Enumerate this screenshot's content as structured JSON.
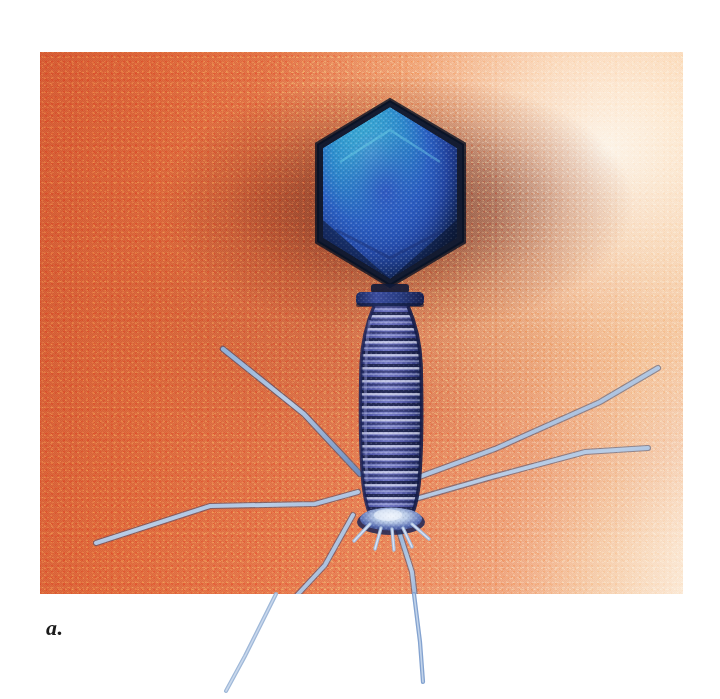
{
  "figure": {
    "panel_label": "a.",
    "image_kind": "colorized-electron-micrograph",
    "plate": {
      "left": 40,
      "top": 52,
      "width": 643,
      "height": 542
    },
    "colors": {
      "background_orange": "#e0703f",
      "background_orange_dark": "#d45c34",
      "background_highlight_cream": "#fbe9d6",
      "vignette_shadow": "#5f1c0e",
      "capsid_rim_dark": "#0e1c33",
      "capsid_cyan": "#3ec3dc",
      "capsid_blue": "#2f5fc0",
      "capsid_deep_blue": "#1b3a86",
      "sheath_purple": "#5a5fb0",
      "sheath_band_light": "#e8ecf6",
      "sheath_band_dark": "#1d2240",
      "collar_blue": "#2b3f87",
      "baseplate_light": "#c7d6ee",
      "fiber_steel_blue": "#7d9ecd",
      "fiber_pale": "#c3d4e8",
      "page_white": "#ffffff",
      "label_black": "#1a1a1a"
    },
    "parts": [
      {
        "id": "capsid",
        "name": "Head (icosahedral capsid)"
      },
      {
        "id": "collar",
        "name": "Collar / neck"
      },
      {
        "id": "sheath",
        "name": "Contractile tail sheath"
      },
      {
        "id": "baseplate",
        "name": "Baseplate"
      },
      {
        "id": "tail-fibers",
        "name": "Tail fibers"
      }
    ],
    "tail_fiber_count": 6
  }
}
